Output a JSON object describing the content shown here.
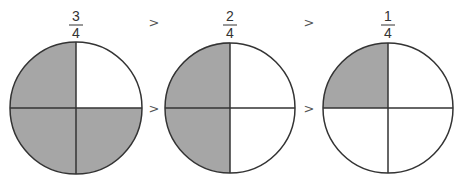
{
  "colors": {
    "shaded": "#a6a6a6",
    "unshaded": "#ffffff",
    "stroke": "#333333",
    "symbol": "#555555"
  },
  "comparison_symbol": ">",
  "fractions": [
    {
      "numerator": "3",
      "denominator": "4",
      "shaded_quadrants": [
        "top-left",
        "bottom-left",
        "bottom-right"
      ]
    },
    {
      "numerator": "2",
      "denominator": "4",
      "shaded_quadrants": [
        "top-left",
        "bottom-left"
      ]
    },
    {
      "numerator": "1",
      "denominator": "4",
      "shaded_quadrants": [
        "top-left"
      ]
    }
  ],
  "comparisons": [
    {
      "top": ">",
      "middle": ">"
    },
    {
      "top": ">",
      "middle": ">"
    }
  ]
}
